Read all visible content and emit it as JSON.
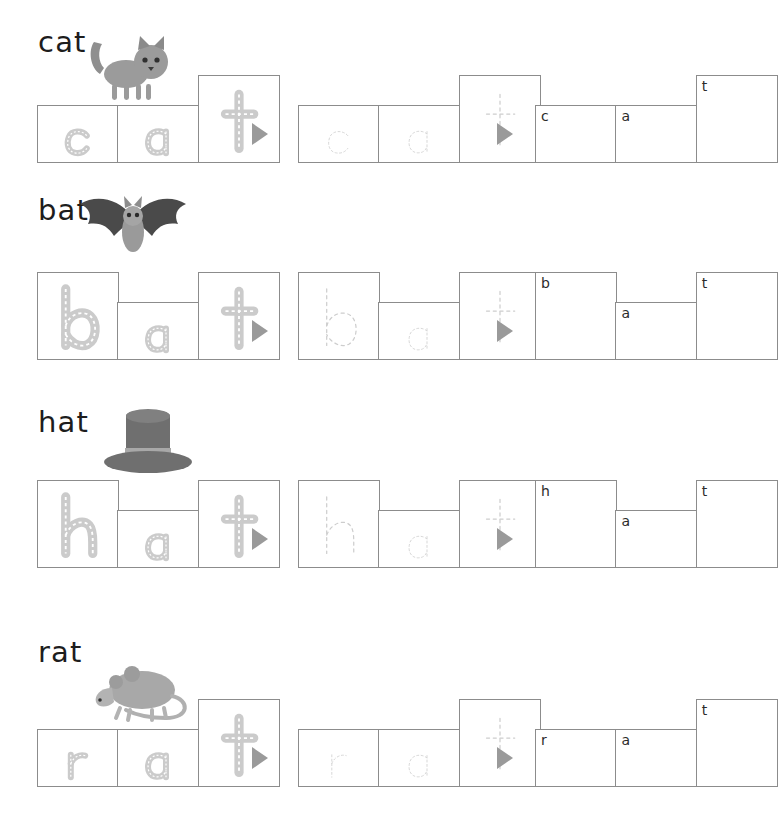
{
  "worksheet": {
    "title": "CVC word building worksheet - at family",
    "colors": {
      "box_border": "#8c8c8c",
      "arrow": "#9a9a9a",
      "road_letter": "#c9c9c9",
      "road_dash": "#ffffff",
      "dotted_letter": "#c8c8c8",
      "text": "#1d1d1d"
    },
    "columns": [
      {
        "name": "traced-road-letters",
        "style": "road"
      },
      {
        "name": "dotted-outline-letters",
        "style": "dotted"
      },
      {
        "name": "empty-boxes-with-hint",
        "style": "blank"
      }
    ],
    "rows": [
      {
        "word": "cat",
        "picture": "cat-illustration",
        "letters": [
          {
            "char": "c",
            "height": "short"
          },
          {
            "char": "a",
            "height": "short"
          },
          {
            "char": "t",
            "height": "tall"
          }
        ]
      },
      {
        "word": "bat",
        "picture": "bat-illustration",
        "letters": [
          {
            "char": "b",
            "height": "tall"
          },
          {
            "char": "a",
            "height": "short"
          },
          {
            "char": "t",
            "height": "tall"
          }
        ]
      },
      {
        "word": "hat",
        "picture": "hat-illustration",
        "letters": [
          {
            "char": "h",
            "height": "tall"
          },
          {
            "char": "a",
            "height": "short"
          },
          {
            "char": "t",
            "height": "tall"
          }
        ]
      },
      {
        "word": "rat",
        "picture": "rat-illustration",
        "letters": [
          {
            "char": "r",
            "height": "short"
          },
          {
            "char": "a",
            "height": "short"
          },
          {
            "char": "t",
            "height": "tall"
          }
        ]
      }
    ],
    "arrows": [
      {
        "name": "arrow-1",
        "glyph": "▶"
      },
      {
        "name": "arrow-2",
        "glyph": "▶"
      }
    ]
  }
}
